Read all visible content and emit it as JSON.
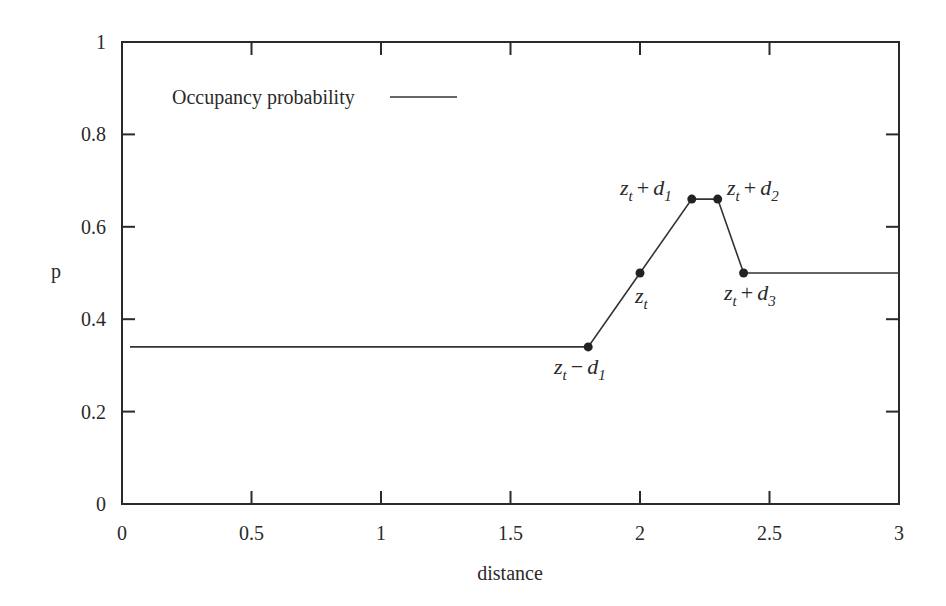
{
  "chart_data": {
    "type": "line",
    "title": "",
    "xlabel": "distance",
    "ylabel": "p",
    "xlim": [
      0,
      3
    ],
    "ylim": [
      0,
      1
    ],
    "grid": false,
    "legend_position": "upper-left",
    "x_ticks": [
      "0",
      "0.5",
      "1",
      "1.5",
      "2",
      "2.5",
      "3"
    ],
    "y_ticks": [
      "0",
      "0.2",
      "0.4",
      "0.6",
      "0.8",
      "1"
    ],
    "series": [
      {
        "name": "Occupancy probability",
        "color": "#333333",
        "x": [
          0.0,
          1.8,
          2.0,
          2.2,
          2.3,
          2.4,
          3.0
        ],
        "y": [
          0.34,
          0.34,
          0.5,
          0.66,
          0.66,
          0.5,
          0.5
        ]
      }
    ],
    "marked_points": [
      {
        "x": 1.8,
        "y": 0.34,
        "label": "z_t − d_1"
      },
      {
        "x": 2.0,
        "y": 0.5,
        "label": "z_t"
      },
      {
        "x": 2.2,
        "y": 0.66,
        "label": "z_t + d_1"
      },
      {
        "x": 2.3,
        "y": 0.66,
        "label": "z_t + d_2"
      },
      {
        "x": 2.4,
        "y": 0.5,
        "label": "z_t + d_3"
      }
    ]
  },
  "legend": {
    "label": "Occupancy probability"
  },
  "axes": {
    "xlabel": "distance",
    "ylabel": "p"
  },
  "annotations": {
    "zt_minus_d1": {
      "base": "z",
      "base_sub": "t",
      "op": "−",
      "var": "d",
      "var_sub": "1"
    },
    "zt": {
      "base": "z",
      "base_sub": "t"
    },
    "zt_plus_d1": {
      "base": "z",
      "base_sub": "t",
      "op": "+",
      "var": "d",
      "var_sub": "1"
    },
    "zt_plus_d2": {
      "base": "z",
      "base_sub": "t",
      "op": "+",
      "var": "d",
      "var_sub": "2"
    },
    "zt_plus_d3": {
      "base": "z",
      "base_sub": "t",
      "op": "+",
      "var": "d",
      "var_sub": "3"
    }
  }
}
